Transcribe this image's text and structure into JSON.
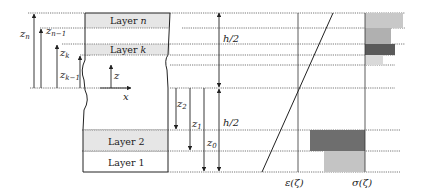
{
  "diagram": {
    "layers": [
      {
        "id": "layer-n",
        "label": "Layer n",
        "fill": "#e6e6e6"
      },
      {
        "id": "layer-k",
        "label": "Layer k",
        "fill": "#e6e6e6"
      },
      {
        "id": "layer-2",
        "label": "Layer 2",
        "fill": "#e6e6e6"
      },
      {
        "id": "layer-1",
        "label": "Layer 1",
        "fill": "#ffffff"
      }
    ],
    "coordinates": {
      "upper": [
        "z",
        "n",
        "z",
        "n−1",
        "z",
        "k",
        "z",
        "k−1"
      ],
      "axes": {
        "z": "z",
        "x": "x"
      },
      "lower": [
        "z",
        "2",
        "z",
        "1",
        "z",
        "0"
      ],
      "half_thickness_top": "h/2",
      "half_thickness_bottom": "h/2"
    },
    "distributions": {
      "strain_label": "ε(ζ)",
      "stress_label": "σ(ζ)"
    },
    "stress_blocks": [
      {
        "layer": "n",
        "shade": "#c8c8c8"
      },
      {
        "layer": "n-1",
        "shade": "#b0b0b0"
      },
      {
        "layer": "k",
        "shade": "#5a5a5a"
      },
      {
        "layer": "k-1",
        "shade": "#d9d9d9"
      },
      {
        "layer": "2",
        "shade": "#6e6e6e"
      },
      {
        "layer": "1",
        "shade": "#c4c4c4"
      }
    ]
  }
}
